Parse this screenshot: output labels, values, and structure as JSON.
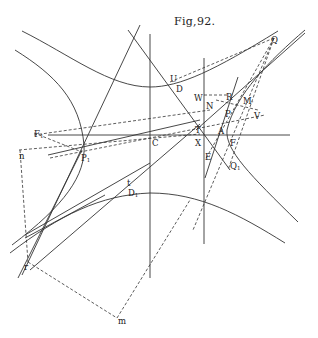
{
  "figure": {
    "title": "Fig,92.",
    "points": [
      {
        "name": "Q",
        "x": 271,
        "y": 36,
        "sub": ""
      },
      {
        "name": "U",
        "x": 170,
        "y": 75,
        "sub": ""
      },
      {
        "name": "D",
        "x": 176,
        "y": 85,
        "sub": ""
      },
      {
        "name": "W",
        "x": 194,
        "y": 94,
        "sub": ""
      },
      {
        "name": "R",
        "x": 226,
        "y": 93,
        "sub": ""
      },
      {
        "name": "M",
        "x": 243,
        "y": 97,
        "sub": "'"
      },
      {
        "name": "N",
        "x": 206,
        "y": 102,
        "sub": ""
      },
      {
        "name": "P",
        "x": 225,
        "y": 110,
        "sub": ""
      },
      {
        "name": "V",
        "x": 254,
        "y": 112,
        "sub": ""
      },
      {
        "name": "F",
        "x": 34,
        "y": 130,
        "sub": "1"
      },
      {
        "name": "T",
        "x": 195,
        "y": 126,
        "sub": ""
      },
      {
        "name": "A",
        "x": 218,
        "y": 127,
        "sub": ""
      },
      {
        "name": "C",
        "x": 152,
        "y": 139,
        "sub": ""
      },
      {
        "name": "X",
        "x": 195,
        "y": 139,
        "sub": ""
      },
      {
        "name": "F",
        "x": 230,
        "y": 139,
        "sub": ""
      },
      {
        "name": "n",
        "x": 19,
        "y": 152,
        "sub": ""
      },
      {
        "name": "P",
        "x": 81,
        "y": 154,
        "sub": "1"
      },
      {
        "name": "E",
        "x": 205,
        "y": 153,
        "sub": ""
      },
      {
        "name": "Q",
        "x": 230,
        "y": 162,
        "sub": "1"
      },
      {
        "name": "t",
        "x": 127,
        "y": 179,
        "sub": ""
      },
      {
        "name": "D",
        "x": 128,
        "y": 189,
        "sub": "1"
      },
      {
        "name": "r",
        "x": 24,
        "y": 263,
        "sub": ""
      },
      {
        "name": "m",
        "x": 118,
        "y": 317,
        "sub": ""
      }
    ]
  }
}
